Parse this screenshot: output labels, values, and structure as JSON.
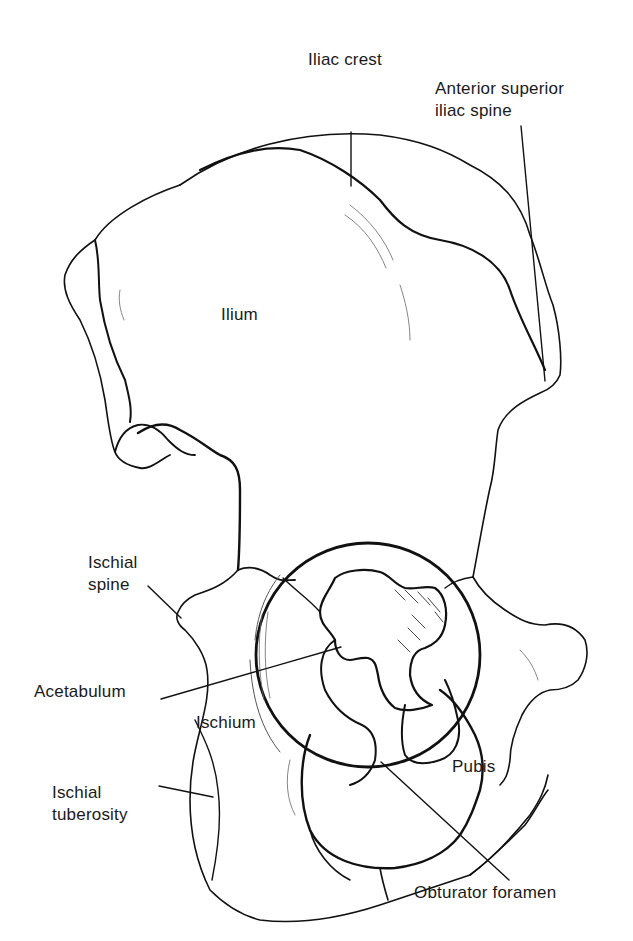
{
  "figure": {
    "stroke_color": "#111111",
    "background": "#ffffff"
  },
  "labels": {
    "iliac_crest": {
      "lines": [
        "Iliac crest"
      ]
    },
    "asis": {
      "lines": [
        "Anterior superior",
        "iliac spine"
      ]
    },
    "ilium": {
      "lines": [
        "Ilium"
      ]
    },
    "ischial_spine": {
      "lines": [
        "Ischial",
        "spine"
      ]
    },
    "acetabulum": {
      "lines": [
        "Acetabulum"
      ]
    },
    "ischium": {
      "lines": [
        "Ischium"
      ]
    },
    "pubis": {
      "lines": [
        "Pubis"
      ]
    },
    "ischial_tuberosity": {
      "lines": [
        "Ischial",
        "tuberosity"
      ]
    },
    "obturator_foramen": {
      "lines": [
        "Obturator foramen"
      ]
    }
  }
}
